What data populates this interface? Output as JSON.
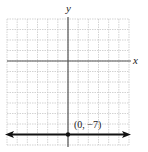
{
  "chart_data": {
    "type": "line",
    "title": "",
    "xlabel": "x",
    "ylabel": "y",
    "xlim": [
      -6,
      6
    ],
    "ylim": [
      -8,
      4
    ],
    "grid": true,
    "grid_step": 1,
    "series": [
      {
        "name": "y = -7",
        "kind": "horizontal-line",
        "equation": "y = -7",
        "x": [
          -6,
          6
        ],
        "y": [
          -7,
          -7
        ],
        "arrows": "both",
        "color": "#111111"
      }
    ],
    "points": [
      {
        "x": 0,
        "y": -7,
        "label": "(0, −7)"
      }
    ],
    "annotations": [
      "(0, −7)"
    ]
  },
  "labels": {
    "x_axis": "x",
    "y_axis": "y",
    "point": "(0, −7)"
  },
  "colors": {
    "grid": "#c8c8c8",
    "axis": "#555555",
    "line": "#111111",
    "background": "#ffffff"
  }
}
